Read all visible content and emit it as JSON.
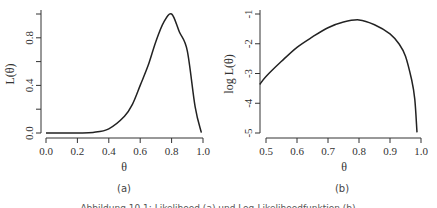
{
  "caption": "Abbildung 10.1: Likelihood (a) und Log-Likelihoodfunktion (b)",
  "chart_data": [
    {
      "panel": "(a)",
      "type": "line",
      "title": "",
      "xlabel": "θ",
      "ylabel": "L(θ)",
      "xlim": [
        0.0,
        1.0
      ],
      "ylim": [
        0.0,
        1.0
      ],
      "xticks": [
        "0.0",
        "0.2",
        "0.4",
        "0.6",
        "0.8",
        "1.0"
      ],
      "yticks": [
        "0.0",
        "0.4",
        "0.8"
      ],
      "ytick_marks": [
        0.0,
        0.2,
        0.4,
        0.6,
        0.8,
        1.0
      ],
      "grid": false,
      "x": [
        0.0,
        0.1,
        0.2,
        0.3,
        0.4,
        0.5,
        0.55,
        0.6,
        0.65,
        0.7,
        0.75,
        0.8,
        0.85,
        0.9,
        0.95,
        0.99
      ],
      "values": [
        0.0,
        0.0,
        0.0004,
        0.0052,
        0.0352,
        0.14,
        0.24,
        0.4,
        0.566,
        0.77,
        0.932,
        1.0,
        0.849,
        0.691,
        0.217,
        0.0022
      ]
    },
    {
      "panel": "(b)",
      "type": "line",
      "title": "",
      "xlabel": "θ",
      "ylabel": "log L(θ)",
      "xlim": [
        0.48,
        1.0
      ],
      "ylim": [
        -5.0,
        -1.0
      ],
      "xticks": [
        "0.5",
        "0.6",
        "0.7",
        "0.8",
        "0.9",
        "1.0"
      ],
      "yticks": [
        "-1",
        "-2",
        "-3",
        "-4",
        "-5"
      ],
      "grid": false,
      "x": [
        0.48,
        0.5,
        0.55,
        0.6,
        0.65,
        0.7,
        0.75,
        0.8,
        0.85,
        0.9,
        0.93,
        0.95,
        0.97,
        0.98,
        0.987
      ],
      "values": [
        -3.37,
        -3.1,
        -2.59,
        -2.12,
        -1.77,
        -1.46,
        -1.27,
        -1.2,
        -1.36,
        -1.67,
        -2.02,
        -2.42,
        -3.22,
        -3.87,
        -4.98
      ]
    }
  ]
}
